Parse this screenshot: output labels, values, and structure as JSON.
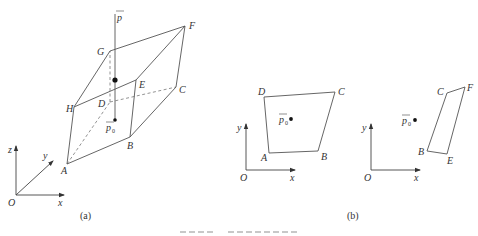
{
  "figure": {
    "panels": [
      {
        "id": "a",
        "caption": "(a)",
        "type": "3d-parallelepiped-with-ray",
        "vertices": {
          "A": [
            67,
            164
          ],
          "B": [
            130,
            137
          ],
          "C": [
            176,
            87
          ],
          "D": [
            110,
            102
          ],
          "E": [
            136,
            80
          ],
          "F": [
            185,
            26
          ],
          "G": [
            110,
            51
          ],
          "H": [
            74,
            107
          ]
        },
        "vertex_labels": [
          "A",
          "B",
          "C",
          "D",
          "E",
          "F",
          "G",
          "H"
        ],
        "solid_edges": [
          [
            "A",
            "B"
          ],
          [
            "B",
            "C"
          ],
          [
            "C",
            "F"
          ],
          [
            "F",
            "G"
          ],
          [
            "G",
            "H"
          ],
          [
            "H",
            "A"
          ],
          [
            "H",
            "E"
          ],
          [
            "E",
            "F"
          ],
          [
            "E",
            "B"
          ]
        ],
        "dashed_edges": [
          [
            "A",
            "D"
          ],
          [
            "D",
            "C"
          ],
          [
            "D",
            "G"
          ]
        ],
        "ray_label": "p",
        "point_label": "p0",
        "axes": {
          "origin_label": "O",
          "x": "x",
          "y": "y",
          "z": "z"
        }
      },
      {
        "id": "b",
        "caption": "(b)",
        "type": "2d-projections",
        "left": {
          "vertices": {
            "A": [
              269,
              153
            ],
            "B": [
              318,
              151
            ],
            "C": [
              335,
              92
            ],
            "D": [
              264,
              97
            ]
          },
          "point_label": "p0",
          "axes": {
            "origin_label": "O",
            "x": "x",
            "y": "y"
          }
        },
        "right": {
          "vertices": {
            "B": [
              427,
              151
            ],
            "E": [
              447,
              154
            ],
            "F": [
              465,
              87
            ],
            "C": [
              447,
              93
            ]
          },
          "point_label": "p0",
          "axes": {
            "origin_label": "O",
            "x": "x",
            "y": "y"
          }
        }
      }
    ],
    "bottom_caption_note": "figure caption clipped at bottom edge (illegible)"
  },
  "labels": {
    "A": "A",
    "B": "B",
    "C": "C",
    "D": "D",
    "E": "E",
    "F": "F",
    "G": "G",
    "H": "H",
    "O": "O",
    "x": "x",
    "y": "y",
    "z": "z",
    "p": "p",
    "p0_main": "p",
    "p0_sub": "0",
    "cap_a": "(a)",
    "cap_b": "(b)"
  }
}
